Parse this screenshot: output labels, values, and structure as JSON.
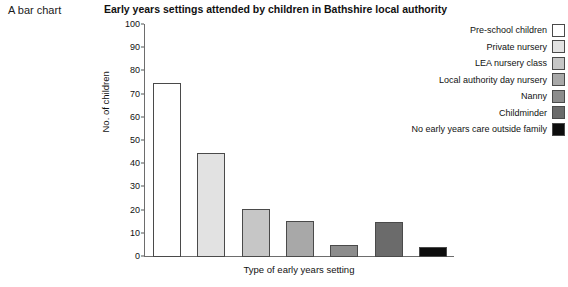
{
  "caption": "A bar chart",
  "chart_data": {
    "type": "bar",
    "title": "Early years settings attended by children in Bathshire local authority",
    "xlabel": "Type of early years setting",
    "ylabel": "No. of children",
    "ylim": [
      0,
      100
    ],
    "yticks": [
      0,
      10,
      20,
      30,
      40,
      50,
      60,
      70,
      80,
      90,
      100
    ],
    "ytick_labels": [
      "0",
      "10",
      "20",
      "30",
      "40",
      "50",
      "60",
      "70",
      "80",
      "90",
      "100"
    ],
    "grid": false,
    "legend_position": "right",
    "categories": [
      "Pre-school children",
      "Private nursery",
      "LEA nursery class",
      "Local authority day nursery",
      "Nanny",
      "Childminder",
      "No early years care outside family"
    ],
    "values": [
      75,
      45,
      20.5,
      15.5,
      5,
      15,
      4.5
    ],
    "colors": [
      "#ffffff",
      "#e2e2e2",
      "#c6c6c6",
      "#a8a8a8",
      "#8c8c8c",
      "#6b6b6b",
      "#0d0d0d"
    ]
  }
}
